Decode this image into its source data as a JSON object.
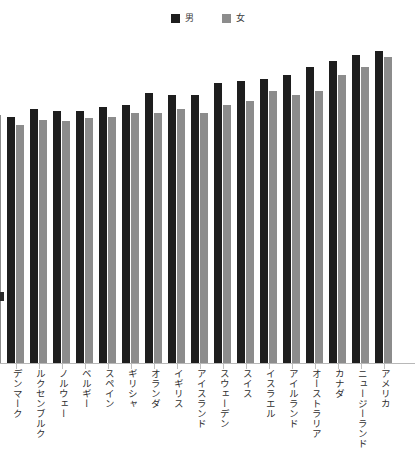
{
  "legend": {
    "position": "top-center",
    "items": [
      {
        "label": "男",
        "color": "#1e1e1e",
        "swatch_name": "legend-swatch-male"
      },
      {
        "label": "女",
        "color": "#8c8c8c",
        "swatch_name": "legend-swatch-female"
      }
    ]
  },
  "colors": {
    "male": "#1e1e1e",
    "female": "#8c8c8c",
    "axis": "#b8b8b8",
    "background": "#ffffff",
    "label_text": "#2e2e2e"
  },
  "chart_data": {
    "type": "bar",
    "title": "",
    "subtitle": "",
    "xlabel": "",
    "ylabel": "",
    "grid": false,
    "legend_position": "top-center",
    "orientation": "vertical",
    "grouping": "grouped",
    "note": "Values are read as relative bar heights in pixels from the baseline; the y-axis is cropped out of the screenshot so no numeric tick labels are visible.",
    "categories": [
      "オーストリア",
      "デンマーク",
      "ルクセンブルク",
      "ノルウェー",
      "ベルギー",
      "スペイン",
      "ギリシャ",
      "オランダ",
      "イギリス",
      "アイスランド",
      "スウェーデン",
      "スイス",
      "イスラエル",
      "アイルランド",
      "オーストラリア",
      "カナダ",
      "ニュージーランド",
      "アメリカ"
    ],
    "series": [
      {
        "name": "男",
        "color": "#1e1e1e",
        "values": [
          null,
          246,
          254,
          252,
          252,
          256,
          258,
          270,
          268,
          268,
          280,
          282,
          284,
          288,
          296,
          302,
          308,
          312
        ]
      },
      {
        "name": "女",
        "color": "#8c8c8c",
        "values": [
          248,
          238,
          243,
          242,
          245,
          246,
          250,
          250,
          254,
          250,
          258,
          262,
          272,
          268,
          272,
          288,
          296,
          306
        ]
      }
    ],
    "ylim": [
      0,
      364
    ],
    "first_category_clipped": true
  },
  "axis": {
    "baseline_y": 363,
    "tick_count": 18
  }
}
